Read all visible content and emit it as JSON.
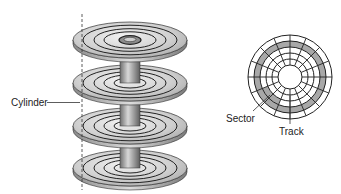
{
  "diagram": {
    "labels": {
      "cylinder": "Cylinder",
      "sector": "Sector",
      "track": "Track"
    },
    "disk_stack": {
      "platter_count": 4,
      "center_x": 130,
      "platter_tops_y": [
        40,
        83,
        126,
        168
      ],
      "rx": 57,
      "ry": 18,
      "track_radii_ratio": [
        0.82,
        0.64,
        0.46,
        0.28
      ]
    },
    "platter_face": {
      "center": [
        290,
        77
      ],
      "ring_radii": [
        42,
        36,
        30,
        24,
        18,
        12
      ],
      "spoke_count": 16,
      "highlighted_track": "ring 2 from outside",
      "highlighted_sector": "ring 3, lower-left segment"
    },
    "colors": {
      "platter_light": "#d9d9d9",
      "platter_dark": "#9a9a9a",
      "highlight": "#a8a8a8",
      "line": "#222222"
    }
  }
}
